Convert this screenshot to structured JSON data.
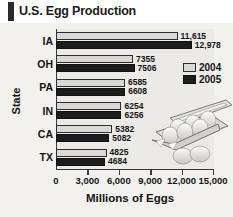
{
  "title": "U.S. Egg Production",
  "decor": {
    "egg_carton": "egg-carton-illustration"
  },
  "legend": {
    "position": "right-upper",
    "entries": [
      {
        "label": "2004",
        "color": "#d9d8d4"
      },
      {
        "label": "2005",
        "color": "#1d1d1d"
      }
    ]
  },
  "chart_data": {
    "type": "bar",
    "orientation": "horizontal",
    "title": "U.S. Egg Production",
    "xlabel": "Millions of Eggs",
    "ylabel": "State",
    "categories": [
      "IA",
      "OH",
      "PA",
      "IN",
      "CA",
      "TX"
    ],
    "series": [
      {
        "name": "2004",
        "color": "#d9d8d4",
        "values": [
          11615,
          7355,
          6585,
          6254,
          5382,
          4825
        ]
      },
      {
        "name": "2005",
        "color": "#1d1d1d",
        "values": [
          12978,
          7506,
          6608,
          6256,
          5082,
          4684
        ]
      }
    ],
    "value_labels": [
      [
        "11,615",
        "7355",
        "6585",
        "6254",
        "5382",
        "4825"
      ],
      [
        "12,978",
        "7506",
        "6608",
        "6256",
        "5082",
        "4684"
      ]
    ],
    "xlim": [
      0,
      15000
    ],
    "xticks": [
      0,
      3000,
      6000,
      9000,
      12000,
      15000
    ],
    "xtick_labels": [
      "0",
      "3,000",
      "6,000",
      "9,000",
      "12,000",
      "15,000"
    ],
    "grid": false,
    "legend_position": "right"
  }
}
